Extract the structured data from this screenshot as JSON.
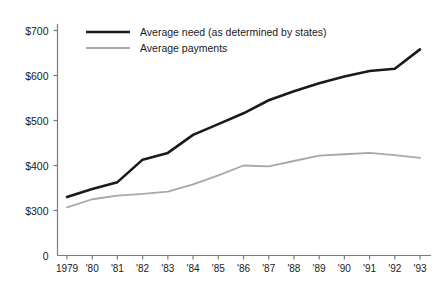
{
  "chart_data": {
    "type": "line",
    "title": "",
    "xlabel": "",
    "ylabel": "",
    "grid": false,
    "legend_position": "top-left",
    "x": [
      1979,
      1980,
      1981,
      1982,
      1983,
      1984,
      1985,
      1986,
      1987,
      1988,
      1989,
      1990,
      1991,
      1992,
      1993
    ],
    "categories": [
      "1979",
      "'80",
      "'81",
      "'82",
      "'83",
      "'84",
      "'85",
      "'86",
      "'87",
      "'88",
      "'89",
      "'90",
      "'91",
      "'92",
      "'93"
    ],
    "ylim": [
      300,
      700
    ],
    "yticks": [
      300,
      400,
      500,
      600,
      700
    ],
    "ytick_labels": [
      "$300",
      "$400",
      "$500",
      "$600",
      "$700"
    ],
    "axis_origin_label": "0",
    "broken_axis": true,
    "series": [
      {
        "name": "Average need (as determined by states)",
        "color": "#1a1a1a",
        "width": 2.6,
        "values": [
          330,
          348,
          363,
          413,
          428,
          468,
          492,
          516,
          545,
          565,
          583,
          598,
          610,
          615,
          658
        ]
      },
      {
        "name": "Average payments",
        "color": "#a8a8a8",
        "width": 1.8,
        "values": [
          307,
          325,
          333,
          337,
          342,
          358,
          378,
          400,
          398,
          410,
          422,
          425,
          428,
          423,
          417
        ]
      }
    ]
  },
  "legend": {
    "items": [
      {
        "label": "Average need (as determined by states)"
      },
      {
        "label": "Average payments"
      }
    ]
  }
}
